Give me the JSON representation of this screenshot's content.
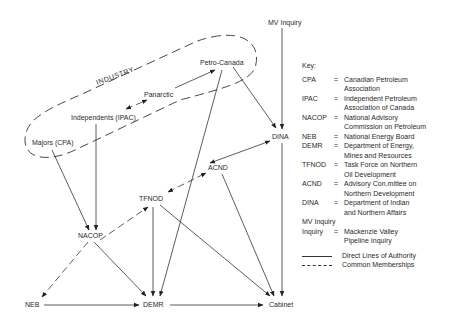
{
  "diagram": {
    "group_label": "INDUSTRY",
    "nodes": {
      "mv_inquiry": "MV Inquiry",
      "petro_canada": "Petro-Canada",
      "panarctic": "Panarctic",
      "independents": "Independents (IPAC)",
      "majors": "Majors (CPA)",
      "dina": "DINA",
      "acnd": "ACND",
      "tfnod": "TFNOD",
      "nacop": "NACOP",
      "neb": "NEB",
      "demr": "DEMR",
      "cabinet": "Cabinet"
    },
    "edges": [
      {
        "from": "MV Inquiry",
        "to": "DINA",
        "type": "direct"
      },
      {
        "from": "Petro-Canada",
        "to": "DINA",
        "type": "direct"
      },
      {
        "from": "Petro-Canada",
        "to": "DEMR",
        "type": "direct"
      },
      {
        "from": "Panarctic",
        "to": "Petro-Canada",
        "type": "direct"
      },
      {
        "from": "Independents (IPAC)",
        "to": "Panarctic",
        "type": "common",
        "bidirectional": true
      },
      {
        "from": "Independents (IPAC)",
        "to": "NACOP",
        "type": "direct"
      },
      {
        "from": "Majors (CPA)",
        "to": "NACOP",
        "type": "direct"
      },
      {
        "from": "ACND",
        "to": "DINA",
        "type": "direct",
        "bidirectional": true
      },
      {
        "from": "TFNOD",
        "to": "ACND",
        "type": "common",
        "bidirectional": true
      },
      {
        "from": "ACND",
        "to": "Cabinet",
        "type": "direct"
      },
      {
        "from": "DINA",
        "to": "Cabinet",
        "type": "direct"
      },
      {
        "from": "TFNOD",
        "to": "DEMR",
        "type": "direct"
      },
      {
        "from": "TFNOD",
        "to": "Cabinet",
        "type": "direct"
      },
      {
        "from": "NACOP",
        "to": "DEMR",
        "type": "direct"
      },
      {
        "from": "NACOP",
        "to": "TFNOD",
        "type": "common"
      },
      {
        "from": "NACOP",
        "to": "NEB",
        "type": "common"
      },
      {
        "from": "NEB",
        "to": "DEMR",
        "type": "direct"
      },
      {
        "from": "DEMR",
        "to": "Cabinet",
        "type": "direct"
      }
    ]
  },
  "key": {
    "title": "Key:",
    "entries": [
      {
        "abbr": "CPA",
        "eq": "=",
        "def": [
          "Canadian Petroleum",
          "Association"
        ]
      },
      {
        "abbr": "IPAC",
        "eq": "=",
        "def": [
          "Independent Petroleum",
          "Association of Canada"
        ]
      },
      {
        "abbr": "NACOP",
        "eq": "=",
        "def": [
          "National Advisory",
          "Commission on Petroleum"
        ]
      },
      {
        "abbr": "NEB",
        "eq": "=",
        "def": [
          "National Energy Board"
        ]
      },
      {
        "abbr": "DEMR",
        "eq": "=",
        "def": [
          "Department of Energy,",
          "Mines and Resources"
        ]
      },
      {
        "abbr": "TFNOD",
        "eq": "=",
        "def": [
          "Task Force on Northern",
          "Oil Development"
        ]
      },
      {
        "abbr": "ACND",
        "eq": "=",
        "def": [
          "Advisory Con.mittee on",
          "Northern Development"
        ]
      },
      {
        "abbr": "DINA",
        "eq": "=",
        "def": [
          "Department of Indian",
          "and Northern Affairs"
        ]
      },
      {
        "abbr": "MV Inquiry",
        "eq": "",
        "def": []
      },
      {
        "abbr": "Inquiry",
        "eq": "=",
        "def": [
          "Mackenzie Valley",
          "Pipeline Inquiry"
        ]
      }
    ],
    "legend": {
      "direct": "Direct Lines of Authority",
      "common": "Common Memberships"
    }
  }
}
